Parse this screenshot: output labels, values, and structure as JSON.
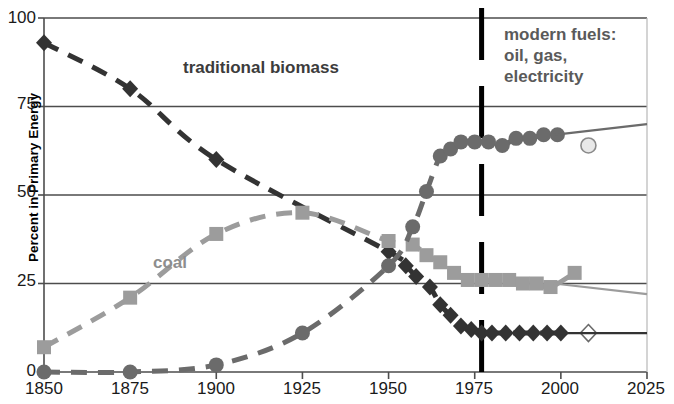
{
  "chart_data": {
    "type": "scatter",
    "title": "",
    "xlabel": "",
    "ylabel": "Percent in Primary Energy",
    "xlim": [
      1850,
      2025
    ],
    "ylim": [
      0,
      100
    ],
    "grid": "horizontal",
    "legend_position": "inline-annotations",
    "xticks": [
      1850,
      1875,
      1900,
      1925,
      1950,
      1975,
      2000,
      2025
    ],
    "yticks": [
      0,
      25,
      50,
      75,
      100
    ],
    "annotations": [
      {
        "id": "traditional-biomass",
        "text": "traditional biomass",
        "color": "#3c3c3c"
      },
      {
        "id": "coal",
        "text": "coal",
        "color": "#8e8e8e"
      },
      {
        "id": "modern-fuels",
        "lines": [
          "modern fuels:",
          "oil, gas,",
          "electricity"
        ],
        "color": "#5a5a5a"
      }
    ],
    "marker_vline": {
      "year": 1977,
      "style": "dashed-thick",
      "color": "#000000"
    },
    "series": [
      {
        "name": "traditional biomass",
        "marker": "diamond",
        "color": "#333333",
        "line_style": "dashed",
        "points": [
          {
            "x": 1850,
            "y": 93
          },
          {
            "x": 1875,
            "y": 80
          },
          {
            "x": 1900,
            "y": 60
          },
          {
            "x": 1950,
            "y": 34
          },
          {
            "x": 1955,
            "y": 30
          },
          {
            "x": 1958,
            "y": 27
          },
          {
            "x": 1962,
            "y": 24
          },
          {
            "x": 1965,
            "y": 19
          },
          {
            "x": 1968,
            "y": 16
          },
          {
            "x": 1971,
            "y": 13
          },
          {
            "x": 1974,
            "y": 12
          },
          {
            "x": 1977,
            "y": 11
          },
          {
            "x": 1980,
            "y": 11
          },
          {
            "x": 1984,
            "y": 11
          },
          {
            "x": 1988,
            "y": 11
          },
          {
            "x": 1992,
            "y": 11
          },
          {
            "x": 1996,
            "y": 11
          },
          {
            "x": 2000,
            "y": 11
          }
        ],
        "open_marker": {
          "x": 2008,
          "y": 11
        }
      },
      {
        "name": "coal",
        "marker": "square",
        "color": "#9c9c9c",
        "line_style": "dashed",
        "points": [
          {
            "x": 1850,
            "y": 7
          },
          {
            "x": 1875,
            "y": 21
          },
          {
            "x": 1900,
            "y": 39
          },
          {
            "x": 1925,
            "y": 45
          },
          {
            "x": 1950,
            "y": 37
          },
          {
            "x": 1957,
            "y": 36
          },
          {
            "x": 1961,
            "y": 33
          },
          {
            "x": 1965,
            "y": 31
          },
          {
            "x": 1969,
            "y": 28
          },
          {
            "x": 1973,
            "y": 26
          },
          {
            "x": 1977,
            "y": 26
          },
          {
            "x": 1981,
            "y": 26
          },
          {
            "x": 1985,
            "y": 26
          },
          {
            "x": 1989,
            "y": 25
          },
          {
            "x": 1993,
            "y": 25
          },
          {
            "x": 1997,
            "y": 24
          },
          {
            "x": 2004,
            "y": 28
          }
        ]
      },
      {
        "name": "modern fuels: oil, gas, electricity",
        "marker": "circle",
        "color": "#6b6b6b",
        "line_style": "dashed",
        "points": [
          {
            "x": 1850,
            "y": 0
          },
          {
            "x": 1875,
            "y": 0
          },
          {
            "x": 1900,
            "y": 2
          },
          {
            "x": 1925,
            "y": 11
          },
          {
            "x": 1950,
            "y": 30
          },
          {
            "x": 1957,
            "y": 41
          },
          {
            "x": 1961,
            "y": 51
          },
          {
            "x": 1965,
            "y": 61
          },
          {
            "x": 1968,
            "y": 63
          },
          {
            "x": 1971,
            "y": 65
          },
          {
            "x": 1975,
            "y": 65
          },
          {
            "x": 1979,
            "y": 65
          },
          {
            "x": 1983,
            "y": 64
          },
          {
            "x": 1987,
            "y": 66
          },
          {
            "x": 1991,
            "y": 66
          },
          {
            "x": 1995,
            "y": 67
          },
          {
            "x": 1999,
            "y": 67
          }
        ],
        "open_marker": {
          "x": 2008,
          "y": 64
        }
      }
    ],
    "trend_lines": [
      {
        "series": "modern fuels",
        "from": {
          "x": 1998,
          "y": 67
        },
        "to": {
          "x": 2025,
          "y": 70
        }
      },
      {
        "series": "coal",
        "from": {
          "x": 1998,
          "y": 25
        },
        "to": {
          "x": 2025,
          "y": 22
        }
      },
      {
        "series": "traditional biomass",
        "from": {
          "x": 1998,
          "y": 11
        },
        "to": {
          "x": 2025,
          "y": 11
        }
      }
    ]
  },
  "axes": {
    "y_label": "Percent in Primary Energy",
    "y_ticks": [
      "0",
      "25",
      "50",
      "75",
      "100"
    ],
    "x_ticks": [
      "1850",
      "1875",
      "1900",
      "1925",
      "1950",
      "1975",
      "2000",
      "2025"
    ]
  },
  "annotations": {
    "biomass": "traditional biomass",
    "coal": "coal",
    "modern_line1": "modern fuels:",
    "modern_line2": "oil, gas,",
    "modern_line3": "electricity"
  },
  "colors": {
    "biomass": "#333333",
    "coal": "#9c9c9c",
    "modern": "#6b6b6b",
    "axis": "#4d4d4d",
    "vline": "#000000"
  }
}
